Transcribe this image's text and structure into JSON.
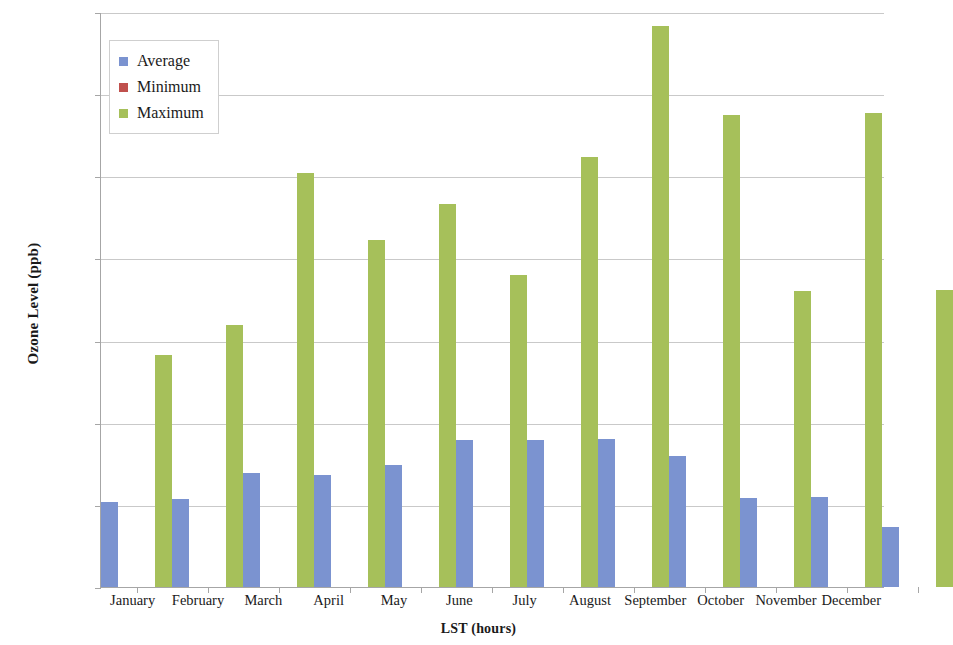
{
  "chart_data": {
    "type": "bar",
    "title": "",
    "xlabel": "LST (hours)",
    "ylabel": "Ozone Level (ppb)",
    "ylim": [
      0.0,
      140.0
    ],
    "ytick_step": 20.0,
    "yticks": [
      "0.0",
      "20.0",
      "40.0",
      "60.0",
      "80.0",
      "100.0",
      "120.0",
      "140.0"
    ],
    "ytick_values": [
      0,
      20,
      40,
      60,
      80,
      100,
      120,
      140
    ],
    "grid": true,
    "legend_position": "upper-left-inside",
    "categories": [
      "January",
      "February",
      "March",
      "April",
      "May",
      "June",
      "July",
      "August",
      "September",
      "October",
      "November",
      "December"
    ],
    "series": [
      {
        "name": "Average",
        "color": "#7b93d0",
        "values": [
          20.8,
          21.5,
          27.7,
          27.2,
          29.8,
          35.8,
          35.9,
          36.1,
          31.8,
          21.6,
          21.8,
          14.7
        ]
      },
      {
        "name": "Minimum",
        "color": "#c0504d",
        "values": [
          0.0,
          0.0,
          0.0,
          0.0,
          0.0,
          0.0,
          0.0,
          0.0,
          0.0,
          0.0,
          0.0,
          0.0
        ]
      },
      {
        "name": "Maximum",
        "color": "#a6c05a",
        "values": [
          56.5,
          63.8,
          100.9,
          84.5,
          93.3,
          75.9,
          104.7,
          136.5,
          115.0,
          72.0,
          115.5,
          72.3
        ]
      }
    ]
  },
  "legend": {
    "items": [
      {
        "label": "Average",
        "color": "#7b93d0"
      },
      {
        "label": "Minimum",
        "color": "#c0504d"
      },
      {
        "label": "Maximum",
        "color": "#a6c05a"
      }
    ]
  }
}
